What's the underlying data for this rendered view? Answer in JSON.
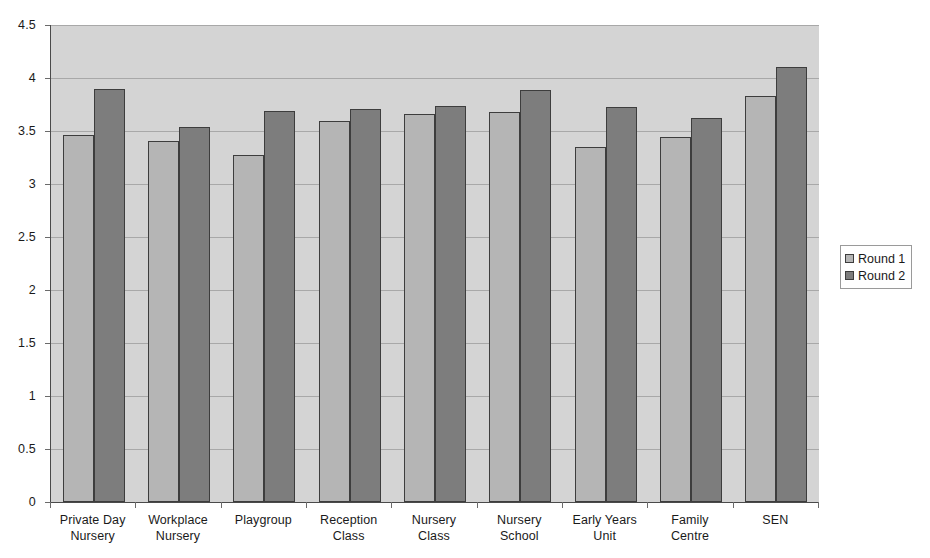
{
  "chart_data": {
    "type": "bar",
    "title": "",
    "xlabel": "",
    "ylabel": "",
    "ylim": [
      0,
      4.5
    ],
    "yticks": [
      "0",
      "0.5",
      "1",
      "1.5",
      "2",
      "2.5",
      "3",
      "3.5",
      "4",
      "4.5"
    ],
    "ytick_values": [
      0,
      0.5,
      1,
      1.5,
      2,
      2.5,
      3,
      3.5,
      4,
      4.5
    ],
    "grid": true,
    "legend_position": "right",
    "categories": [
      "Private Day\nNursery",
      "Workplace\nNursery",
      "Playgroup",
      "Reception\nClass",
      "Nursery\nClass",
      "Nursery\nSchool",
      "Early Years\nUnit",
      "Family\nCentre",
      "SEN"
    ],
    "series": [
      {
        "name": "Round 1",
        "color": "#b5b5b5",
        "values": [
          3.46,
          3.41,
          3.27,
          3.59,
          3.66,
          3.68,
          3.35,
          3.44,
          3.83
        ]
      },
      {
        "name": "Round 2",
        "color": "#7d7d7d",
        "values": [
          3.9,
          3.54,
          3.69,
          3.71,
          3.74,
          3.89,
          3.73,
          3.62,
          4.1
        ]
      }
    ],
    "plot_background": "#d4d4d4",
    "gridline_color": "#a8a8a8",
    "axis_color": "#4a4a4a"
  }
}
